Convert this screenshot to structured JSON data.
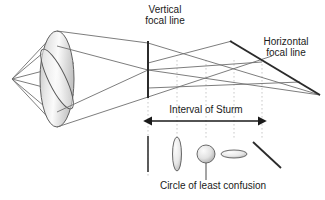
{
  "figure": {
    "background_color": "#ffffff",
    "width": 325,
    "height": 200,
    "labels": {
      "vertical_focal_line": "Vertical\nfocal line",
      "vertical_focal_line_l1": "Vertical",
      "vertical_focal_line_l2": "focal line",
      "horizontal_focal_line_l1": "Horizontal",
      "horizontal_focal_line_l2": "focal line",
      "interval_of_sturm": "Interval of Sturm",
      "circle_of_least_confusion": "Circle of least confusion"
    },
    "colors": {
      "ray_stroke": "#6e6e6e",
      "focal_line_stroke": "#2b2b2b",
      "dotted_guide": "#c9c9c9",
      "arrow": "#1a1a1a",
      "text": "#1a1a1a",
      "lens_fill_light": "#fdfdfd",
      "lens_fill_dark": "#b9b9b9",
      "spot_fill_light": "#f4f4f4",
      "spot_fill_dark": "#b0b0b0"
    },
    "elements": {
      "source_apex": {
        "x": 12,
        "y": 79
      },
      "lens": {
        "cx": 57,
        "cy": 79,
        "rx": 17,
        "ry": 48,
        "name": "astigmatic-lens-ellipse"
      },
      "lens_inner": {
        "cx": 57,
        "cy": 79,
        "rx": 9,
        "ry": 34,
        "rotation": -28,
        "name": "lens-inner-tilted-ellipse"
      },
      "vertical_focal_line": {
        "x": 148,
        "y1": 41,
        "y2": 98
      },
      "horizontal_focal_line": {
        "x1": 230,
        "y1": 41,
        "x2": 320,
        "y2": 95
      },
      "sturm_arrow": {
        "x1": 148,
        "x2": 262,
        "y": 121
      },
      "guides_x": [
        148,
        177,
        206,
        234,
        262
      ],
      "beam_cross_sections": [
        {
          "name": "vertical-line-section",
          "x": 148,
          "type": "line-vertical"
        },
        {
          "name": "tall-ellipse-section",
          "x": 177,
          "type": "ellipse-tall"
        },
        {
          "name": "circle-of-least-confusion-spot",
          "x": 206,
          "type": "circle"
        },
        {
          "name": "flat-ellipse-section",
          "x": 234,
          "type": "ellipse-flat"
        },
        {
          "name": "diagonal-line-section",
          "x": 262,
          "type": "line-diagonal"
        }
      ]
    }
  }
}
